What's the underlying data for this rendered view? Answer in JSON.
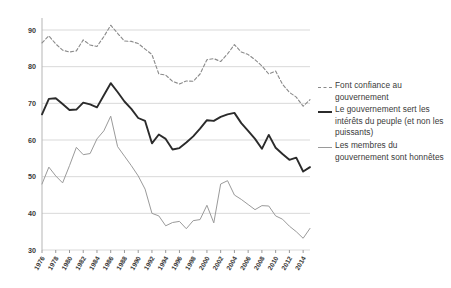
{
  "chart_data": {
    "type": "line",
    "title": "",
    "xlabel": "",
    "ylabel": "",
    "ylim": [
      30,
      90
    ],
    "yticks": [
      30,
      40,
      50,
      60,
      70,
      80,
      90
    ],
    "grid": true,
    "legend_position": "right",
    "x": [
      1976,
      1977,
      1978,
      1979,
      1980,
      1981,
      1982,
      1983,
      1984,
      1985,
      1986,
      1987,
      1988,
      1989,
      1990,
      1991,
      1992,
      1993,
      1994,
      1995,
      1996,
      1997,
      1998,
      1999,
      2000,
      2001,
      2002,
      2003,
      2004,
      2005,
      2006,
      2007,
      2008,
      2009,
      2010,
      2011,
      2012,
      2013,
      2014,
      2015
    ],
    "xtick_labels": [
      "1976",
      "1978",
      "1980",
      "1982",
      "1984",
      "1986",
      "1988",
      "1990",
      "1992",
      "1994",
      "1996",
      "1998",
      "2000",
      "2002",
      "2004",
      "2006",
      "2008",
      "2010",
      "2012",
      "2014"
    ],
    "series": [
      {
        "name": "Font confiance au gouvernement",
        "style": "dashed",
        "color": "#8a8a8a",
        "values": [
          86.5,
          88.4,
          86.2,
          84.5,
          84.0,
          84.3,
          87.3,
          85.9,
          85.5,
          88.2,
          91.3,
          89.1,
          87.0,
          86.9,
          86.3,
          84.8,
          83.3,
          78.0,
          77.7,
          76.0,
          75.3,
          76.1,
          76.0,
          78.0,
          81.9,
          82.2,
          81.4,
          83.5,
          86.0,
          84.0,
          83.3,
          81.9,
          80.2,
          78.0,
          78.8,
          75.2,
          73.0,
          71.7,
          69.2,
          71.0
        ]
      },
      {
        "name": "Le gouvernement sert les intérêts du peuple (et non les puissants)",
        "style": "solid-thick",
        "color": "#2b2b2b",
        "values": [
          67.0,
          71.2,
          71.4,
          69.8,
          68.2,
          68.3,
          70.2,
          69.7,
          68.9,
          72.2,
          75.5,
          73.1,
          70.5,
          68.5,
          66.0,
          65.2,
          59.1,
          61.5,
          60.3,
          57.4,
          57.8,
          59.3,
          61.0,
          63.1,
          65.4,
          65.2,
          66.3,
          67.0,
          67.4,
          64.6,
          62.5,
          60.3,
          57.6,
          61.4,
          57.9,
          56.2,
          54.6,
          55.2,
          51.4,
          52.6
        ]
      },
      {
        "name": "Les membres du gouvernement sont honnêtes",
        "style": "solid-thin",
        "color": "#9a9a9a",
        "values": [
          48.0,
          52.6,
          50.2,
          48.3,
          53.0,
          58.0,
          56.0,
          56.3,
          60.3,
          62.5,
          66.5,
          58.2,
          55.6,
          53.0,
          50.2,
          46.6,
          40.0,
          39.3,
          36.6,
          37.5,
          37.8,
          35.8,
          38.0,
          38.3,
          42.2,
          37.4,
          48.0,
          48.9,
          45.0,
          43.8,
          42.4,
          41.0,
          42.1,
          42.0,
          39.3,
          38.4,
          36.5,
          35.0,
          33.2,
          35.9
        ]
      }
    ]
  },
  "legend": {
    "entries": [
      {
        "label": "Font confiance au gouvernement",
        "marker": "dashed-line-icon"
      },
      {
        "label": "Le gouvernement sert les intérêts du peuple (et non les puissants)",
        "marker": "solid-thick-line-icon"
      },
      {
        "label": "Les membres du gouvernement sont honnêtes",
        "marker": "solid-thin-line-icon"
      }
    ]
  }
}
